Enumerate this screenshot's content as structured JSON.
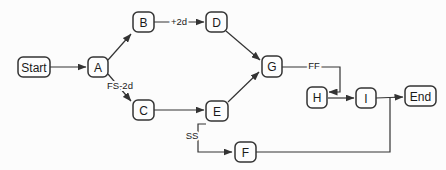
{
  "diagram": {
    "type": "activity-network",
    "colors": {
      "background": "#fcfcfc",
      "stroke": "#333333",
      "node_fill": "#fdfdfd",
      "text": "#1a1a1a"
    },
    "nodes": [
      {
        "id": "start",
        "label": "Start",
        "x": 18,
        "y": 57,
        "w": 32,
        "h": 20
      },
      {
        "id": "a",
        "label": "A",
        "x": 88,
        "y": 57,
        "w": 20,
        "h": 20
      },
      {
        "id": "b",
        "label": "B",
        "x": 133,
        "y": 12,
        "w": 21,
        "h": 20
      },
      {
        "id": "d",
        "label": "D",
        "x": 206,
        "y": 12,
        "w": 21,
        "h": 20
      },
      {
        "id": "c",
        "label": "C",
        "x": 133,
        "y": 100,
        "w": 21,
        "h": 20
      },
      {
        "id": "e",
        "label": "E",
        "x": 206,
        "y": 101,
        "w": 22,
        "h": 20
      },
      {
        "id": "g",
        "label": "G",
        "x": 262,
        "y": 56,
        "w": 20,
        "h": 21
      },
      {
        "id": "h",
        "label": "H",
        "x": 307,
        "y": 87,
        "w": 20,
        "h": 21
      },
      {
        "id": "i",
        "label": "I",
        "x": 356,
        "y": 88,
        "w": 20,
        "h": 20
      },
      {
        "id": "end",
        "label": "End",
        "x": 405,
        "y": 86,
        "w": 31,
        "h": 20
      },
      {
        "id": "f",
        "label": "F",
        "x": 235,
        "y": 142,
        "w": 21,
        "h": 20
      }
    ],
    "edges": [
      {
        "id": "start-a",
        "from": "start",
        "to": "a",
        "arrow": true,
        "points": [
          [
            50,
            67
          ],
          [
            86,
            67
          ]
        ]
      },
      {
        "id": "a-b",
        "from": "a",
        "to": "b",
        "arrow": true,
        "points": [
          [
            108,
            60
          ],
          [
            131,
            34
          ]
        ]
      },
      {
        "id": "a-c",
        "from": "a",
        "to": "c",
        "arrow": true,
        "points": [
          [
            108,
            74
          ],
          [
            131,
            101
          ]
        ],
        "label": "FS-2d",
        "label_x": 120,
        "label_y": 86
      },
      {
        "id": "b-d",
        "from": "b",
        "to": "d",
        "arrow": true,
        "points": [
          [
            154,
            22
          ],
          [
            204,
            22
          ]
        ],
        "label": "+2d",
        "label_x": 179,
        "label_y": 22
      },
      {
        "id": "c-e",
        "from": "c",
        "to": "e",
        "arrow": true,
        "points": [
          [
            154,
            110
          ],
          [
            204,
            110
          ]
        ]
      },
      {
        "id": "d-g",
        "from": "d",
        "to": "g",
        "arrow": true,
        "points": [
          [
            226,
            31
          ],
          [
            260,
            60
          ]
        ]
      },
      {
        "id": "e-g",
        "from": "e",
        "to": "g",
        "arrow": true,
        "points": [
          [
            228,
            102
          ],
          [
            259,
            72
          ]
        ]
      },
      {
        "id": "g-h",
        "from": "g",
        "to": "h",
        "arrow": true,
        "points": [
          [
            282,
            67
          ],
          [
            340,
            67
          ],
          [
            340,
            92
          ],
          [
            329,
            92
          ]
        ],
        "label": "FF",
        "label_x": 314,
        "label_y": 66
      },
      {
        "id": "h-i",
        "from": "h",
        "to": "i",
        "arrow": true,
        "points": [
          [
            328,
            98
          ],
          [
            354,
            98
          ]
        ]
      },
      {
        "id": "i-end",
        "from": "i",
        "to": "end",
        "arrow": true,
        "points": [
          [
            376,
            98
          ],
          [
            403,
            97
          ]
        ]
      },
      {
        "id": "e-f",
        "from": "e",
        "to": "f",
        "arrow": true,
        "points": [
          [
            206,
            124
          ],
          [
            198,
            124
          ],
          [
            198,
            152
          ],
          [
            232,
            152
          ]
        ],
        "label": "SS",
        "label_x": 192,
        "label_y": 136
      },
      {
        "id": "f-join",
        "from": "f",
        "to": "end",
        "arrow": false,
        "points": [
          [
            256,
            152
          ],
          [
            390,
            152
          ],
          [
            390,
            98
          ]
        ]
      }
    ]
  }
}
